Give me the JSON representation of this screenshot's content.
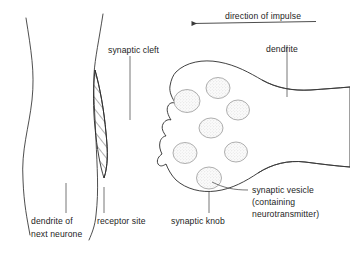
{
  "diagram": {
    "background_color": "#ffffff",
    "ink_color": "#2b2b2b",
    "vesicle_fill_color": "#f2f2f2",
    "text_color": "#1d1d1d"
  },
  "labels": {
    "direction_of_impulse": "direction of impulse",
    "dendrite": "dendrite",
    "synaptic_cleft": "synaptic cleft",
    "dendrite_of_next_neurone_line1": "dendrite of",
    "dendrite_of_next_neurone_line2": "next neurone",
    "receptor_site": "receptor site",
    "synaptic_knob": "synaptic knob",
    "synaptic_vesicle_line1": "synaptic vesicle",
    "synaptic_vesicle_line2": "(containing",
    "synaptic_vesicle_line3": "neurotransmitter)"
  },
  "structures": {
    "vesicle_count": 7,
    "vesicles": [
      {
        "cx": 187,
        "cy": 101,
        "rx": 13,
        "ry": 11.5
      },
      {
        "cx": 218,
        "cy": 88,
        "rx": 12,
        "ry": 10.5
      },
      {
        "cx": 238,
        "cy": 110,
        "rx": 11.5,
        "ry": 10
      },
      {
        "cx": 211,
        "cy": 128,
        "rx": 12,
        "ry": 10
      },
      {
        "cx": 185,
        "cy": 153,
        "rx": 12,
        "ry": 10.5
      },
      {
        "cx": 236,
        "cy": 152,
        "rx": 11.5,
        "ry": 10
      },
      {
        "cx": 209,
        "cy": 178,
        "rx": 12.5,
        "ry": 11
      }
    ]
  },
  "arrow": {
    "direction": "left",
    "x_start": 316,
    "x_end": 190,
    "y": 22
  }
}
